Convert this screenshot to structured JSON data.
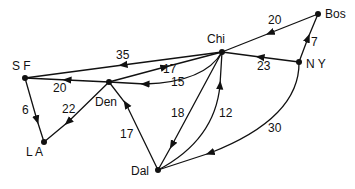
{
  "nodes": [
    {
      "id": "Bos",
      "label": "Bos",
      "x": 318,
      "y": 14
    },
    {
      "id": "SF",
      "label": "S F",
      "x": 25,
      "y": 78
    },
    {
      "id": "Chi",
      "label": "Chi",
      "x": 222,
      "y": 52
    },
    {
      "id": "NY",
      "label": "N Y",
      "x": 299,
      "y": 62
    },
    {
      "id": "Den",
      "label": "Den",
      "x": 109,
      "y": 82
    },
    {
      "id": "LA",
      "label": "L A",
      "x": 44,
      "y": 142
    },
    {
      "id": "Dal",
      "label": "Dal",
      "x": 158,
      "y": 170
    }
  ],
  "edges": [
    {
      "from": "Bos",
      "to": "Chi",
      "weight": "20"
    },
    {
      "from": "NY",
      "to": "Bos",
      "weight": "7"
    },
    {
      "from": "NY",
      "to": "Chi",
      "weight": "23"
    },
    {
      "from": "Chi",
      "to": "SF",
      "weight": "35"
    },
    {
      "from": "Den",
      "to": "Chi",
      "weight": "17"
    },
    {
      "from": "Chi",
      "to": "Den",
      "weight": "15"
    },
    {
      "from": "Den",
      "to": "SF",
      "weight": "20"
    },
    {
      "from": "SF",
      "to": "LA",
      "weight": "6"
    },
    {
      "from": "Den",
      "to": "LA",
      "weight": "22"
    },
    {
      "from": "Dal",
      "to": "Den",
      "weight": "17"
    },
    {
      "from": "Chi",
      "to": "Dal",
      "weight": "18"
    },
    {
      "from": "Dal",
      "to": "Chi",
      "weight": "12"
    },
    {
      "from": "NY",
      "to": "Dal",
      "weight": "30"
    }
  ],
  "labels": {
    "bos": "Bos",
    "sf": "S F",
    "chi": "Chi",
    "ny": "N Y",
    "den": "Den",
    "la": "L A",
    "dal": "Dal",
    "w_bos_chi": "20",
    "w_ny_bos": "7",
    "w_ny_chi": "23",
    "w_chi_sf": "35",
    "w_den_chi": "17",
    "w_chi_den": "15",
    "w_den_sf": "20",
    "w_sf_la": "6",
    "w_den_la": "22",
    "w_dal_den": "17",
    "w_chi_dal": "18",
    "w_dal_chi": "12",
    "w_ny_dal": "30"
  }
}
